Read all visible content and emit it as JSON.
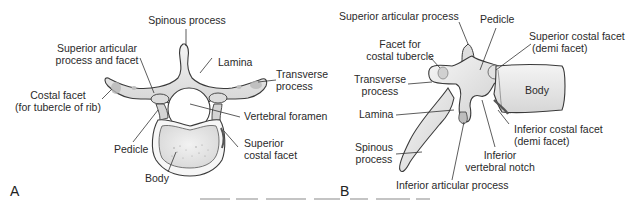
{
  "panel_a": {
    "letter": "A",
    "labels": {
      "spinous_process": "Spinous process",
      "superior_articular_1": "Superior articular",
      "superior_articular_2": "process and facet",
      "lamina": "Lamina",
      "transverse_1": "Transverse",
      "transverse_2": "process",
      "costal_facet_1": "Costal facet",
      "costal_facet_2": "(for tubercle of rib)",
      "vertebral_foramen": "Vertebral foramen",
      "pedicle": "Pedicle",
      "superior_costal_1": "Superior",
      "superior_costal_2": "costal facet",
      "body": "Body"
    }
  },
  "panel_b": {
    "letter": "B",
    "labels": {
      "superior_articular": "Superior articular process",
      "pedicle": "Pedicle",
      "facet_costal_1": "Facet for",
      "facet_costal_2": "costal tubercle",
      "superior_costal_1": "Superior costal facet",
      "superior_costal_2": "(demi facet)",
      "transverse_1": "Transverse",
      "transverse_2": "process",
      "body": "Body",
      "lamina": "Lamina",
      "inferior_costal_1": "Inferior costal facet",
      "inferior_costal_2": "(demi facet)",
      "spinous_1": "Spinous",
      "spinous_2": "process",
      "inferior_notch_1": "Inferior",
      "inferior_notch_2": "vertebral notch",
      "inferior_articular": "Inferior articular process"
    }
  },
  "colors": {
    "bone_fill": "#e9e9e9",
    "bone_shade": "#c9c9c9",
    "outline": "#3a3a3a",
    "leader": "#333333"
  }
}
